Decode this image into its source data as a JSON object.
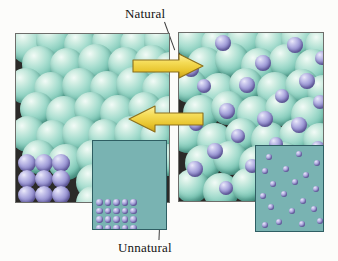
{
  "figure": {
    "type": "scientific-illustration",
    "labels": {
      "top": "Natural",
      "bottom": "Unnatural"
    }
  },
  "colors": {
    "background": "#fcfcfa",
    "panel_background": "#2b2a28",
    "panel_border": "#6d6d6a",
    "host_atom": "#8fd4c2",
    "solute_atom": "#9590d0",
    "inset_background": "#79b3b2",
    "inset_border": "#2f5e63",
    "arrow_fill": "#f2d64b",
    "arrow_stroke": "#8c6f1c",
    "leader_line": "#3d3d3d",
    "label_text": "#141414"
  },
  "panels": {
    "left": {
      "name": "unmixed-state",
      "description": "Pure host metal spheres with a separate ordered crystal of solute atoms",
      "host_spheres": [
        {
          "x": -6,
          "y": -8,
          "r": 19
        },
        {
          "x": 20,
          "y": -12,
          "r": 18
        },
        {
          "x": 48,
          "y": -6,
          "r": 17
        },
        {
          "x": 76,
          "y": -10,
          "r": 18
        },
        {
          "x": 104,
          "y": -7,
          "r": 17
        },
        {
          "x": 128,
          "y": -11,
          "r": 18
        },
        {
          "x": 6,
          "y": 12,
          "r": 18
        },
        {
          "x": 34,
          "y": 14,
          "r": 17
        },
        {
          "x": 62,
          "y": 10,
          "r": 18
        },
        {
          "x": 92,
          "y": 13,
          "r": 17
        },
        {
          "x": 118,
          "y": 11,
          "r": 18
        },
        {
          "x": 138,
          "y": 18,
          "r": 16
        },
        {
          "x": -8,
          "y": 34,
          "r": 18
        },
        {
          "x": 18,
          "y": 38,
          "r": 17
        },
        {
          "x": 46,
          "y": 34,
          "r": 18
        },
        {
          "x": 74,
          "y": 37,
          "r": 17
        },
        {
          "x": 100,
          "y": 33,
          "r": 18
        },
        {
          "x": 126,
          "y": 38,
          "r": 17
        },
        {
          "x": 4,
          "y": 58,
          "r": 17
        },
        {
          "x": 30,
          "y": 62,
          "r": 18
        },
        {
          "x": 58,
          "y": 58,
          "r": 17
        },
        {
          "x": 84,
          "y": 61,
          "r": 18
        },
        {
          "x": 112,
          "y": 58,
          "r": 17
        },
        {
          "x": 136,
          "y": 62,
          "r": 17
        },
        {
          "x": -6,
          "y": 82,
          "r": 18
        },
        {
          "x": 20,
          "y": 86,
          "r": 17
        },
        {
          "x": 46,
          "y": 82,
          "r": 18
        },
        {
          "x": 72,
          "y": 85,
          "r": 17
        },
        {
          "x": 98,
          "y": 82,
          "r": 18
        },
        {
          "x": 124,
          "y": 86,
          "r": 17
        },
        {
          "x": 6,
          "y": 106,
          "r": 17
        },
        {
          "x": 32,
          "y": 110,
          "r": 18
        },
        {
          "x": 60,
          "y": 106,
          "r": 17
        },
        {
          "x": 86,
          "y": 109,
          "r": 18
        },
        {
          "x": 112,
          "y": 106,
          "r": 17
        },
        {
          "x": 136,
          "y": 110,
          "r": 16
        },
        {
          "x": 60,
          "y": 130,
          "r": 18
        },
        {
          "x": 86,
          "y": 134,
          "r": 17
        },
        {
          "x": 110,
          "y": 130,
          "r": 18
        },
        {
          "x": 60,
          "y": 152,
          "r": 17
        },
        {
          "x": 88,
          "y": 150,
          "r": 17
        },
        {
          "x": 114,
          "y": 154,
          "r": 16
        }
      ],
      "solute_lattice": {
        "origin_x": 2,
        "origin_y": 120,
        "cols": 3,
        "rows": 5,
        "spacing_x": 17,
        "spacing_y": 16,
        "radius": 9
      }
    },
    "right": {
      "name": "mixed-state",
      "description": "Solid solution: solute atoms dispersed among host atoms",
      "host_spheres": [
        {
          "x": -4,
          "y": -10,
          "r": 18
        },
        {
          "x": 22,
          "y": -6,
          "r": 17
        },
        {
          "x": 48,
          "y": -11,
          "r": 18
        },
        {
          "x": 76,
          "y": -7,
          "r": 17
        },
        {
          "x": 102,
          "y": -12,
          "r": 18
        },
        {
          "x": 126,
          "y": -5,
          "r": 17
        },
        {
          "x": 8,
          "y": 14,
          "r": 18
        },
        {
          "x": 36,
          "y": 10,
          "r": 17
        },
        {
          "x": 62,
          "y": 15,
          "r": 18
        },
        {
          "x": 90,
          "y": 11,
          "r": 17
        },
        {
          "x": 116,
          "y": 16,
          "r": 18
        },
        {
          "x": -6,
          "y": 36,
          "r": 17
        },
        {
          "x": 22,
          "y": 40,
          "r": 18
        },
        {
          "x": 50,
          "y": 35,
          "r": 17
        },
        {
          "x": 78,
          "y": 39,
          "r": 18
        },
        {
          "x": 106,
          "y": 36,
          "r": 17
        },
        {
          "x": 128,
          "y": 42,
          "r": 16
        },
        {
          "x": 4,
          "y": 62,
          "r": 18
        },
        {
          "x": 32,
          "y": 58,
          "r": 17
        },
        {
          "x": 58,
          "y": 63,
          "r": 18
        },
        {
          "x": 86,
          "y": 59,
          "r": 17
        },
        {
          "x": 112,
          "y": 64,
          "r": 18
        },
        {
          "x": -8,
          "y": 86,
          "r": 17
        },
        {
          "x": 18,
          "y": 90,
          "r": 18
        },
        {
          "x": 46,
          "y": 85,
          "r": 17
        },
        {
          "x": 72,
          "y": 89,
          "r": 18
        },
        {
          "x": 100,
          "y": 86,
          "r": 17
        },
        {
          "x": 124,
          "y": 90,
          "r": 17
        },
        {
          "x": 6,
          "y": 112,
          "r": 18
        },
        {
          "x": 34,
          "y": 108,
          "r": 17
        },
        {
          "x": 60,
          "y": 113,
          "r": 18
        },
        {
          "x": 88,
          "y": 109,
          "r": 17
        },
        {
          "x": 114,
          "y": 114,
          "r": 18
        },
        {
          "x": -4,
          "y": 136,
          "r": 17
        },
        {
          "x": 24,
          "y": 140,
          "r": 18
        },
        {
          "x": 52,
          "y": 135,
          "r": 17
        },
        {
          "x": 80,
          "y": 139,
          "r": 18
        },
        {
          "x": 106,
          "y": 136,
          "r": 17
        },
        {
          "x": 128,
          "y": 142,
          "r": 16
        }
      ],
      "solute_spheres": [
        {
          "x": 36,
          "y": 2,
          "r": 8
        },
        {
          "x": 108,
          "y": 4,
          "r": 8
        },
        {
          "x": 136,
          "y": 18,
          "r": 7
        },
        {
          "x": 4,
          "y": 28,
          "r": 8
        },
        {
          "x": 76,
          "y": 22,
          "r": 8
        },
        {
          "x": 18,
          "y": 46,
          "r": 7
        },
        {
          "x": 60,
          "y": 44,
          "r": 8
        },
        {
          "x": 120,
          "y": 40,
          "r": 8
        },
        {
          "x": 96,
          "y": 56,
          "r": 7
        },
        {
          "x": 134,
          "y": 62,
          "r": 7
        },
        {
          "x": 40,
          "y": 70,
          "r": 8
        },
        {
          "x": 78,
          "y": 78,
          "r": 8
        },
        {
          "x": 10,
          "y": 84,
          "r": 7
        },
        {
          "x": 112,
          "y": 84,
          "r": 8
        },
        {
          "x": 52,
          "y": 96,
          "r": 7
        },
        {
          "x": 28,
          "y": 110,
          "r": 8
        },
        {
          "x": 90,
          "y": 104,
          "r": 7
        },
        {
          "x": 132,
          "y": 108,
          "r": 7
        },
        {
          "x": 8,
          "y": 128,
          "r": 8
        },
        {
          "x": 66,
          "y": 126,
          "r": 7
        },
        {
          "x": 104,
          "y": 132,
          "r": 8
        },
        {
          "x": 40,
          "y": 148,
          "r": 7
        }
      ]
    }
  },
  "arrows": [
    {
      "name": "arrow-natural-right",
      "direction": "right",
      "label": "Natural",
      "x": 132,
      "y": 53,
      "width": 72,
      "height": 26
    },
    {
      "name": "arrow-unnatural-left",
      "direction": "left",
      "label": "Unnatural",
      "x": 128,
      "y": 104,
      "width": 76,
      "height": 30
    }
  ],
  "insets": {
    "left": {
      "name": "ordered-phase-inset",
      "description": "Teal field with an ordered square lattice of solute dots in the lower-left",
      "lattice": {
        "origin_x": 3,
        "origin_y": 58,
        "cols": 5,
        "rows": 4,
        "spacing_x": 8.5,
        "spacing_y": 8.5,
        "radius": 3.4
      }
    },
    "right": {
      "name": "disordered-phase-inset",
      "description": "Teal field with randomly dispersed solute dots",
      "dots": [
        {
          "x": 10,
          "y": 8,
          "r": 3.2
        },
        {
          "x": 40,
          "y": 5,
          "r": 3.0
        },
        {
          "x": 58,
          "y": 14,
          "r": 3.2
        },
        {
          "x": 6,
          "y": 22,
          "r": 3.0
        },
        {
          "x": 27,
          "y": 20,
          "r": 3.2
        },
        {
          "x": 47,
          "y": 26,
          "r": 3.0
        },
        {
          "x": 14,
          "y": 35,
          "r": 3.2
        },
        {
          "x": 36,
          "y": 33,
          "r": 3.0
        },
        {
          "x": 57,
          "y": 40,
          "r": 3.2
        },
        {
          "x": 4,
          "y": 47,
          "r": 3.0
        },
        {
          "x": 25,
          "y": 45,
          "r": 3.2
        },
        {
          "x": 44,
          "y": 52,
          "r": 3.0
        },
        {
          "x": 12,
          "y": 58,
          "r": 3.2
        },
        {
          "x": 33,
          "y": 62,
          "r": 3.0
        },
        {
          "x": 55,
          "y": 60,
          "r": 3.2
        },
        {
          "x": 20,
          "y": 73,
          "r": 3.0
        },
        {
          "x": 43,
          "y": 75,
          "r": 3.2
        },
        {
          "x": 61,
          "y": 72,
          "r": 3.0
        },
        {
          "x": 6,
          "y": 76,
          "r": 3.0
        }
      ]
    }
  }
}
